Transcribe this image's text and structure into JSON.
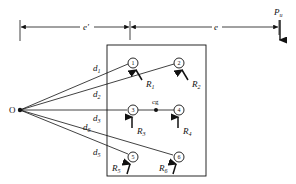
{
  "diagram": {
    "type": "eccentrically loaded bolt group",
    "origin_label": "O",
    "cg_label": "cg",
    "load": {
      "symbol": "P",
      "subscript": "u"
    },
    "dimensions": {
      "e_prime": "e'",
      "e": "e"
    },
    "bolts": [
      {
        "id": "1",
        "reaction": "R",
        "reaction_sub": "1",
        "distance": "d",
        "distance_sub": "1"
      },
      {
        "id": "2",
        "reaction": "R",
        "reaction_sub": "2",
        "distance": "d",
        "distance_sub": "2"
      },
      {
        "id": "3",
        "reaction": "R",
        "reaction_sub": "3",
        "distance": "d",
        "distance_sub": "3"
      },
      {
        "id": "4",
        "reaction": "R",
        "reaction_sub": "4",
        "distance": "d",
        "distance_sub": "4"
      },
      {
        "id": "5",
        "reaction": "R",
        "reaction_sub": "5",
        "distance": "d",
        "distance_sub": "5"
      },
      {
        "id": "6",
        "reaction": "R",
        "reaction_sub": "6",
        "distance": "d",
        "distance_sub": "6"
      }
    ],
    "colors": {
      "ink": "#111111",
      "background": "#ffffff"
    }
  }
}
